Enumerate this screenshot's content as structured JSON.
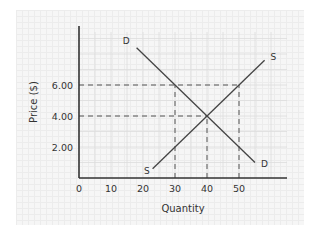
{
  "chart_data": {
    "type": "line",
    "title": "",
    "xlabel": "Quantity",
    "ylabel": "Price ($)",
    "xlim": [
      0,
      65
    ],
    "ylim": [
      0,
      8.4
    ],
    "xticks": [
      0,
      10,
      20,
      30,
      40,
      50
    ],
    "xtick_labels": [
      "0",
      "10",
      "20",
      "30",
      "40",
      "50"
    ],
    "yticks": [
      2,
      4,
      6
    ],
    "ytick_labels": [
      "2.00",
      "4.00",
      "6.00"
    ],
    "grid": true,
    "legend": "none",
    "series": [
      {
        "name": "Demand",
        "label": "D",
        "points": [
          [
            18,
            8.4
          ],
          [
            55,
            1.0
          ]
        ]
      },
      {
        "name": "Supply",
        "label": "S",
        "points": [
          [
            23,
            0.6
          ],
          [
            58,
            7.6
          ]
        ]
      }
    ],
    "reference_lines": [
      {
        "name": "price-6-guide",
        "type": "horizontal",
        "y": 6,
        "x_from": 0,
        "x_to": 50
      },
      {
        "name": "price-4-guide",
        "type": "horizontal",
        "y": 4,
        "x_from": 0,
        "x_to": 40
      },
      {
        "name": "qty-30-guide",
        "type": "vertical",
        "x": 30,
        "y_from": 0,
        "y_to": 6
      },
      {
        "name": "qty-40-guide",
        "type": "vertical",
        "x": 40,
        "y_from": 0,
        "y_to": 4
      },
      {
        "name": "qty-50-guide",
        "type": "vertical",
        "x": 50,
        "y_from": 0,
        "y_to": 6
      }
    ],
    "equilibrium": {
      "quantity": 40,
      "price": 4.0
    }
  },
  "colors": {
    "curve": "#444444",
    "axis": "#333333",
    "guide": "#555555",
    "grid": "#dddddd"
  }
}
